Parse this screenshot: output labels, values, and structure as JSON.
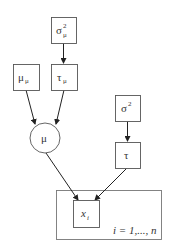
{
  "diagram": {
    "type": "plate-notation graphical model",
    "nodes": [
      {
        "id": "sigma2_mu",
        "shape": "box",
        "label": "σ",
        "superscript": "2",
        "subscript": "μ"
      },
      {
        "id": "mu_mu",
        "shape": "box",
        "label": "μ",
        "subscript": "μ"
      },
      {
        "id": "tau_mu",
        "shape": "box",
        "label": "τ",
        "subscript": "μ"
      },
      {
        "id": "mu",
        "shape": "circle",
        "label": "μ"
      },
      {
        "id": "sigma2",
        "shape": "box",
        "label": "σ",
        "superscript": "2"
      },
      {
        "id": "tau",
        "shape": "box",
        "label": "τ"
      },
      {
        "id": "x_i",
        "shape": "box",
        "label": "x",
        "subscript": "i"
      }
    ],
    "edges": [
      {
        "from": "sigma2_mu",
        "to": "tau_mu"
      },
      {
        "from": "mu_mu",
        "to": "mu"
      },
      {
        "from": "tau_mu",
        "to": "mu"
      },
      {
        "from": "sigma2",
        "to": "tau"
      },
      {
        "from": "mu",
        "to": "x_i"
      },
      {
        "from": "tau",
        "to": "x_i"
      }
    ],
    "plate": {
      "label": "i = 1,..., n",
      "contains": [
        "x_i"
      ]
    }
  },
  "labels": {
    "sigma2_mu": {
      "base": "σ",
      "sup": "2",
      "sub": "μ"
    },
    "mu_mu": {
      "base": "μ",
      "sub": "μ"
    },
    "tau_mu": {
      "base": "τ",
      "sub": "μ"
    },
    "mu": {
      "base": "μ"
    },
    "sigma2": {
      "base": "σ",
      "sup": "2"
    },
    "tau": {
      "base": "τ"
    },
    "x_i": {
      "base": "x",
      "sub": "i"
    },
    "plate": "i = 1,..., n"
  }
}
